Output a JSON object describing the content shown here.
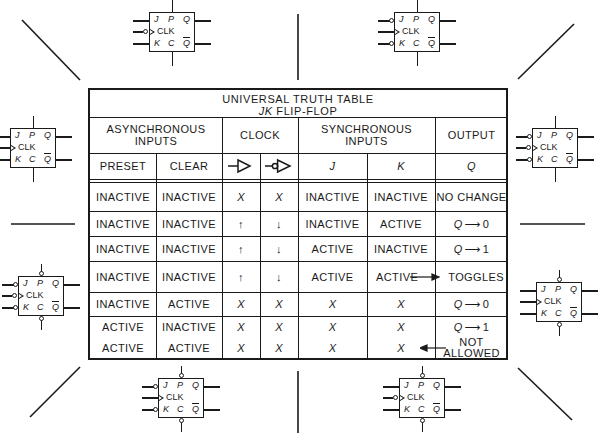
{
  "table": {
    "title_line1": "UNIVERSAL TRUTH TABLE",
    "title_line2_italic": "JK",
    "title_line2_rest": " FLIP-FLOP",
    "group_headers": {
      "async": "ASYNCHRONOUS INPUTS",
      "clock": "CLOCK",
      "sync": "SYNCHRONOUS INPUTS",
      "output": "OUTPUT"
    },
    "sub_headers": {
      "preset": "PRESET",
      "clear": "CLEAR",
      "clock_rising_symbol": "positive-edge-clock-symbol",
      "clock_falling_symbol": "negative-edge-clock-symbol",
      "j": "J",
      "k": "K",
      "q": "Q"
    },
    "rows": [
      {
        "preset": "INACTIVE",
        "clear": "INACTIVE",
        "clk_pos": "X",
        "clk_neg": "X",
        "j": "INACTIVE",
        "k": "INACTIVE",
        "output": "NO CHANGE"
      },
      {
        "preset": "INACTIVE",
        "clear": "INACTIVE",
        "clk_pos": "↑",
        "clk_neg": "↓",
        "j": "INACTIVE",
        "k": "ACTIVE",
        "output_q": "Q",
        "output_arrow": "⟶",
        "output_val": "0"
      },
      {
        "preset": "INACTIVE",
        "clear": "INACTIVE",
        "clk_pos": "↑",
        "clk_neg": "↓",
        "j": "ACTIVE",
        "k": "INACTIVE",
        "output_q": "Q",
        "output_arrow": "⟶",
        "output_val": "1"
      },
      {
        "preset": "INACTIVE",
        "clear": "INACTIVE",
        "clk_pos": "↑",
        "clk_neg": "↓",
        "j": "ACTIVE",
        "k": "ACTIVE",
        "output": "TOGGLES"
      },
      {
        "preset": "INACTIVE",
        "clear": "ACTIVE",
        "clk_pos": "X",
        "clk_neg": "X",
        "j": "X",
        "k": "X",
        "output_q": "Q",
        "output_arrow": "⟶",
        "output_val": "0"
      },
      {
        "preset": "ACTIVE",
        "clear": "INACTIVE",
        "clk_pos": "X",
        "clk_neg": "X",
        "j": "X",
        "k": "X",
        "output_q": "Q",
        "output_arrow": "⟶",
        "output_val": "1"
      },
      {
        "preset": "ACTIVE",
        "clear": "ACTIVE",
        "clk_pos": "X",
        "clk_neg": "X",
        "j": "X",
        "k": "X",
        "output_line1": "NOT",
        "output_line2": "ALLOWED"
      }
    ]
  },
  "flip_flop_symbols": [
    {
      "position": "top-left",
      "labels": {
        "j": "J",
        "p": "P",
        "q": "Q",
        "clk": "CLK",
        "k": "K",
        "c": "C",
        "qbar": "Q"
      },
      "clk_inverted": true,
      "jk_inverted": false,
      "pc_inverted": false
    },
    {
      "position": "top-right",
      "labels": {
        "j": "J",
        "p": "P",
        "q": "Q",
        "clk": "CLK",
        "k": "K",
        "c": "C",
        "qbar": "Q"
      },
      "clk_inverted": false,
      "jk_inverted": true,
      "pc_inverted": false
    },
    {
      "position": "left-upper",
      "labels": {
        "j": "J",
        "p": "P",
        "q": "Q",
        "clk": "CLK",
        "k": "K",
        "c": "C",
        "qbar": "Q"
      },
      "clk_inverted": false,
      "jk_inverted": false,
      "pc_inverted": false
    },
    {
      "position": "right-upper",
      "labels": {
        "j": "J",
        "p": "P",
        "q": "Q",
        "clk": "CLK",
        "k": "K",
        "c": "C",
        "qbar": "Q"
      },
      "clk_inverted": true,
      "jk_inverted": true,
      "pc_inverted": false
    },
    {
      "position": "left-lower",
      "labels": {
        "j": "J",
        "p": "P",
        "q": "Q",
        "clk": "CLK",
        "k": "K",
        "c": "C",
        "qbar": "Q"
      },
      "clk_inverted": true,
      "jk_inverted": true,
      "pc_inverted": true
    },
    {
      "position": "right-lower",
      "labels": {
        "j": "J",
        "p": "P",
        "q": "Q",
        "clk": "CLK",
        "k": "K",
        "c": "C",
        "qbar": "Q"
      },
      "clk_inverted": false,
      "jk_inverted": false,
      "pc_inverted": true
    },
    {
      "position": "bottom-left",
      "labels": {
        "j": "J",
        "p": "P",
        "q": "Q",
        "clk": "CLK",
        "k": "K",
        "c": "C",
        "qbar": "Q"
      },
      "clk_inverted": false,
      "jk_inverted": true,
      "pc_inverted": true
    },
    {
      "position": "bottom-right",
      "labels": {
        "j": "J",
        "p": "P",
        "q": "Q",
        "clk": "CLK",
        "k": "K",
        "c": "C",
        "qbar": "Q"
      },
      "clk_inverted": true,
      "jk_inverted": false,
      "pc_inverted": true
    }
  ],
  "colors": {
    "ink": "#1a1a1a",
    "paper": "#ffffff"
  }
}
